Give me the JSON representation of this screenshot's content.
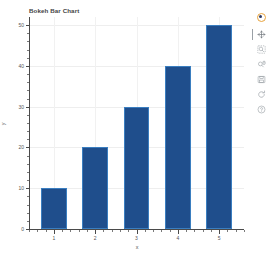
{
  "chart_data": {
    "type": "bar",
    "title": "Bokeh Bar Chart",
    "xlabel": "x",
    "ylabel": "y",
    "categories": [
      "1",
      "2",
      "3",
      "4",
      "5"
    ],
    "values": [
      10,
      20,
      30,
      40,
      50
    ],
    "x": [
      1,
      2,
      3,
      4,
      5
    ],
    "xlim": [
      0.4,
      5.6
    ],
    "ylim": [
      0,
      52
    ],
    "x_tick_labels": [
      "1",
      "2",
      "3",
      "4",
      "5"
    ],
    "y_tick_labels": [
      "0",
      "10",
      "20",
      "30",
      "40",
      "50"
    ],
    "y_ticks": [
      0,
      10,
      20,
      30,
      40,
      50
    ],
    "grid": true,
    "legend": null,
    "bar_color": "#1f4e8c",
    "bar_line_color": "#3a7ec0",
    "background_color": "#ffffff",
    "grid_color": "#eeeeee",
    "axis_color": "#4a4a4a"
  },
  "toolbar": {
    "logo_label": "Bokeh",
    "tools": [
      {
        "name": "pan-tool",
        "label": "Pan",
        "active": true
      },
      {
        "name": "box-zoom-tool",
        "label": "Box Zoom",
        "active": false
      },
      {
        "name": "wheel-zoom-tool",
        "label": "Wheel Zoom",
        "active": false
      },
      {
        "name": "save-tool",
        "label": "Save",
        "active": false
      },
      {
        "name": "reset-tool",
        "label": "Reset",
        "active": false
      },
      {
        "name": "help-tool",
        "label": "Help",
        "active": false
      }
    ]
  }
}
